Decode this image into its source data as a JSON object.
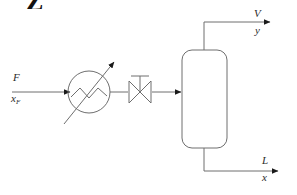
{
  "figure": {
    "corner_mark": "Z",
    "line_color": "#6e6e6e",
    "label_color": "#2b2b2b",
    "background": "#ffffff"
  },
  "streams": {
    "feed": {
      "name_label": "F",
      "composition_label": "x",
      "composition_subscript": "F"
    },
    "vapor": {
      "name_label": "V",
      "composition_label": "y"
    },
    "liquid": {
      "name_label": "L",
      "composition_label": "x"
    }
  },
  "equipment": {
    "heater": {
      "name": "variable-heat-exchanger",
      "symbol": "circle-with-zigzag-and-diagonal-arrow"
    },
    "valve": {
      "name": "throttling-valve",
      "symbol": "bowtie-valve-with-stem-handle"
    },
    "vessel": {
      "name": "flash-drum",
      "symbol": "rounded-rectangle-vessel"
    }
  }
}
